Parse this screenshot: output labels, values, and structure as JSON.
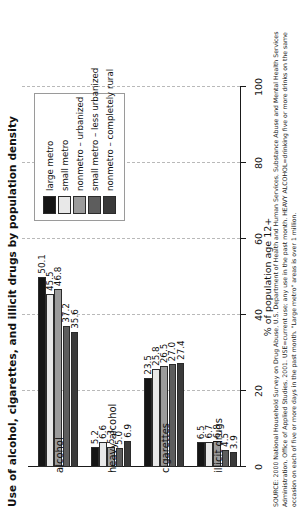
{
  "title": "Use of alcohol, cigarettes, and illicit drugs by population density",
  "axis": {
    "label": "% of population age 12+",
    "ticks": [
      "0",
      "20",
      "40",
      "60",
      "80",
      "100"
    ],
    "min": 0,
    "max": 100
  },
  "legend": {
    "items": [
      {
        "label": "large metro",
        "color": "#151515"
      },
      {
        "label": "small metro",
        "color": "#e8e8e8"
      },
      {
        "label": "nonmetro – urbanized",
        "color": "#9b9b9b"
      },
      {
        "label": "small metro – less urbanized",
        "color": "#5d5d5d"
      },
      {
        "label": "nonmetro – completely rural",
        "color": "#3a3a3a"
      }
    ]
  },
  "chart_data": {
    "type": "bar",
    "title": "Use of alcohol, cigarettes, and illicit drugs by population density",
    "xlabel": "% of population age 12+",
    "ylabel": "",
    "xlim": [
      0,
      100
    ],
    "grid": true,
    "legend_position": "top-right",
    "orientation": "horizontal",
    "categories": [
      "alcohol",
      "heavy alcohol",
      "cigarettes",
      "illicit drugs"
    ],
    "series": [
      {
        "name": "large metro",
        "values": [
          50.1,
          5.2,
          23.5,
          6.5
        ]
      },
      {
        "name": "small metro",
        "values": [
          45.5,
          6.6,
          25.8,
          6.7
        ]
      },
      {
        "name": "nonmetro – urbanized",
        "values": [
          46.8,
          5.3,
          26.5,
          6.8
        ]
      },
      {
        "name": "small metro – less urbanized",
        "values": [
          37.2,
          5.0,
          27.0,
          4.5
        ]
      },
      {
        "name": "nonmetro – completely rural",
        "values": [
          35.6,
          6.9,
          27.4,
          3.9
        ]
      }
    ]
  },
  "source": "SOURCE: 2000 National Household Survey on Drug Abuse, U.S. Department of Health and Human Services, Substance Abuse and Mental Health Services Administration, Office of Applied Studies, 2001. USE=current use; any use in the past month. HEAVY ALCOHOL=drinking five or more drinks on the same occasion on each of five or more days in the past month. \"Large metro\" areas is over 1 million."
}
